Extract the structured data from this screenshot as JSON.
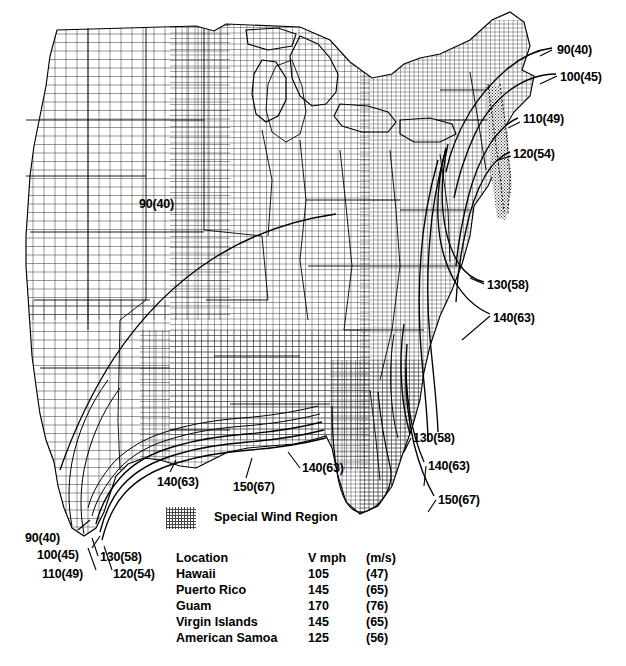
{
  "map": {
    "title": "Basic Wind Speed Map",
    "region": "Eastern and Central United States",
    "background_color": "#ffffff",
    "line_color": "#000000"
  },
  "contour_labels": [
    {
      "id": "interior-90",
      "text": "90(40)",
      "x": 139,
      "y": 198
    },
    {
      "id": "ne-90",
      "text": "90(40)",
      "x": 557,
      "y": 44
    },
    {
      "id": "ne-100",
      "text": "100(45)",
      "x": 560,
      "y": 71
    },
    {
      "id": "ne-110",
      "text": "110(49)",
      "x": 523,
      "y": 113
    },
    {
      "id": "ne-120",
      "text": "120(54)",
      "x": 513,
      "y": 148
    },
    {
      "id": "atl-130",
      "text": "130(58)",
      "x": 487,
      "y": 279
    },
    {
      "id": "atl-140",
      "text": "140(63)",
      "x": 493,
      "y": 312
    },
    {
      "id": "fl-130",
      "text": "130(58)",
      "x": 413,
      "y": 432
    },
    {
      "id": "fl-140",
      "text": "140(63)",
      "x": 428,
      "y": 460
    },
    {
      "id": "fl-150",
      "text": "150(67)",
      "x": 438,
      "y": 494
    },
    {
      "id": "gulf-140-mid",
      "text": "140(63)",
      "x": 302,
      "y": 462
    },
    {
      "id": "gulf-150",
      "text": "150(67)",
      "x": 233,
      "y": 481
    },
    {
      "id": "gulf-140-west",
      "text": "140(63)",
      "x": 157,
      "y": 476
    },
    {
      "id": "tx-90",
      "text": "90(40)",
      "x": 25,
      "y": 532
    },
    {
      "id": "tx-100",
      "text": "100(45)",
      "x": 37,
      "y": 549
    },
    {
      "id": "tx-130",
      "text": "130(58)",
      "x": 100,
      "y": 551
    },
    {
      "id": "tx-110",
      "text": "110(49)",
      "x": 42,
      "y": 568
    },
    {
      "id": "tx-120",
      "text": "120(54)",
      "x": 113,
      "y": 568
    }
  ],
  "legend": {
    "swatch_label": "Special Wind Region",
    "swatch_pattern": "stipple-halftone",
    "table": {
      "headers": [
        "Location",
        "V mph",
        "(m/s)"
      ],
      "rows": [
        {
          "location": "Hawaii",
          "mph": "105",
          "ms": "(47)"
        },
        {
          "location": "Puerto Rico",
          "mph": "145",
          "ms": "(65)"
        },
        {
          "location": "Guam",
          "mph": "170",
          "ms": "(76)"
        },
        {
          "location": "Virgin Islands",
          "mph": "145",
          "ms": "(65)"
        },
        {
          "location": "American Samoa",
          "mph": "125",
          "ms": "(56)"
        }
      ]
    }
  }
}
